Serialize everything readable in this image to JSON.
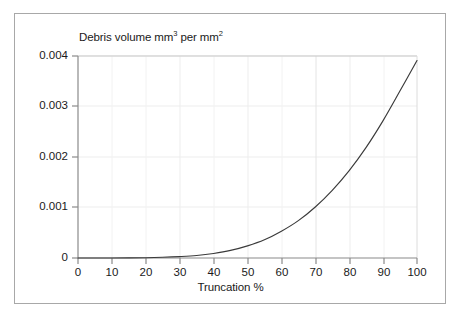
{
  "chart_data": {
    "type": "line",
    "title": "",
    "xlabel": "Truncation %",
    "ylabel_text_parts": {
      "prefix": "Debris volume mm",
      "sup1": "3",
      "middle": " per mm",
      "sup2": "2"
    },
    "ylabel": "Debris volume mm3 per mm2",
    "xlim": [
      0,
      100
    ],
    "ylim": [
      0,
      0.004
    ],
    "xticks": [
      0,
      10,
      20,
      30,
      40,
      50,
      60,
      70,
      80,
      90,
      100
    ],
    "xtick_labels": [
      "0",
      "10",
      "20",
      "30",
      "40",
      "50",
      "60",
      "70",
      "80",
      "90",
      "100"
    ],
    "yticks": [
      0,
      0.001,
      0.002,
      0.003,
      0.004
    ],
    "ytick_labels": [
      "0",
      "0.001",
      "0.002",
      "0.003",
      "0.004"
    ],
    "grid": true,
    "legend": false,
    "line_color": "#3a3a3a",
    "grid_color": "#ededed",
    "axis_color": "#8a8a8a",
    "frame_color": "#a8a8a8",
    "background": "#ffffff",
    "series": [
      {
        "name": "Debris volume",
        "x": [
          0,
          5,
          10,
          15,
          20,
          25,
          30,
          35,
          40,
          45,
          50,
          55,
          60,
          65,
          70,
          75,
          80,
          85,
          90,
          95,
          100
        ],
        "values": [
          0.0,
          0.0,
          0.0,
          2e-06,
          6e-06,
          1.4e-05,
          2.8e-05,
          5e-05,
          9e-05,
          0.00015,
          0.00024,
          0.00036,
          0.00053,
          0.00074,
          0.00101,
          0.00134,
          0.00173,
          0.00219,
          0.00272,
          0.00331,
          0.00391
        ]
      }
    ]
  },
  "figure": {
    "x_axis_title": "Truncation %"
  }
}
